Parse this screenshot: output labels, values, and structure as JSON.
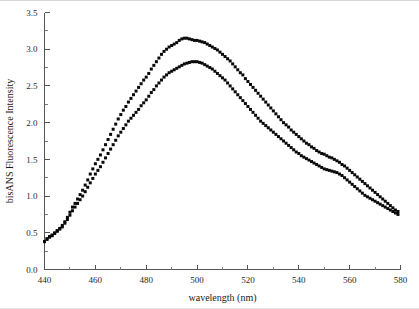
{
  "figure": {
    "background_color": "#ffffff",
    "marker_color": "#0a0a0a",
    "axis_color": "#555555"
  },
  "chart_data": {
    "type": "scatter",
    "title": "",
    "subtitle": "",
    "xlabel": "wavelength (nm)",
    "ylabel": "bisANS Fluorescence Intensity",
    "xlim": [
      440,
      580
    ],
    "ylim": [
      0.0,
      3.5
    ],
    "grid": false,
    "legend": "none",
    "x_ticks": [
      440,
      460,
      480,
      500,
      520,
      540,
      560,
      580
    ],
    "x_tick_labels": [
      "440",
      "460",
      "480",
      "500",
      "520",
      "540",
      "560",
      "580"
    ],
    "x_minor_tick_step": 10,
    "y_ticks": [
      0.0,
      0.5,
      1.0,
      1.5,
      2.0,
      2.5,
      3.0,
      3.5
    ],
    "y_tick_labels": [
      "0.0",
      "0.5",
      "1.0",
      "1.5",
      "2.0",
      "2.5",
      "3.0",
      "3.5"
    ],
    "y_minor_tick_step": 0.25,
    "marker_shape": "square",
    "marker_size_px": 3,
    "series": [
      {
        "name": "upper curve",
        "x": [
          440,
          441,
          442,
          443,
          444,
          445,
          446,
          447,
          448,
          449,
          450,
          451,
          452,
          453,
          454,
          455,
          456,
          457,
          458,
          459,
          460,
          461,
          462,
          463,
          464,
          465,
          466,
          467,
          468,
          469,
          470,
          471,
          472,
          473,
          474,
          475,
          476,
          477,
          478,
          479,
          480,
          481,
          482,
          483,
          484,
          485,
          486,
          487,
          488,
          489,
          490,
          491,
          492,
          493,
          494,
          495,
          496,
          497,
          498,
          499,
          500,
          501,
          502,
          503,
          504,
          505,
          506,
          507,
          508,
          509,
          510,
          511,
          512,
          513,
          514,
          515,
          516,
          517,
          518,
          519,
          520,
          521,
          522,
          523,
          524,
          525,
          526,
          527,
          528,
          529,
          530,
          531,
          532,
          533,
          534,
          535,
          536,
          537,
          538,
          539,
          540,
          541,
          542,
          543,
          544,
          545,
          546,
          547,
          548,
          549,
          550,
          551,
          552,
          553,
          554,
          555,
          556,
          557,
          558,
          559,
          560,
          561,
          562,
          563,
          564,
          565,
          566,
          567,
          568,
          569,
          570,
          571,
          572,
          573,
          574,
          575,
          576,
          577,
          578,
          579
        ],
        "y": [
          0.38,
          0.42,
          0.45,
          0.47,
          0.5,
          0.53,
          0.56,
          0.6,
          0.65,
          0.71,
          0.78,
          0.85,
          0.9,
          0.96,
          1.02,
          1.08,
          1.15,
          1.22,
          1.3,
          1.37,
          1.44,
          1.5,
          1.56,
          1.63,
          1.7,
          1.77,
          1.84,
          1.91,
          1.98,
          2.05,
          2.11,
          2.17,
          2.22,
          2.28,
          2.33,
          2.38,
          2.43,
          2.48,
          2.53,
          2.58,
          2.62,
          2.67,
          2.73,
          2.78,
          2.83,
          2.88,
          2.93,
          2.97,
          3.0,
          3.03,
          3.05,
          3.07,
          3.09,
          3.12,
          3.14,
          3.15,
          3.15,
          3.14,
          3.13,
          3.12,
          3.12,
          3.11,
          3.1,
          3.09,
          3.07,
          3.05,
          3.03,
          3.01,
          2.99,
          2.96,
          2.93,
          2.9,
          2.87,
          2.84,
          2.8,
          2.76,
          2.72,
          2.68,
          2.65,
          2.6,
          2.56,
          2.52,
          2.48,
          2.44,
          2.4,
          2.36,
          2.32,
          2.28,
          2.24,
          2.2,
          2.16,
          2.12,
          2.08,
          2.04,
          2.0,
          1.97,
          1.94,
          1.9,
          1.87,
          1.84,
          1.81,
          1.78,
          1.75,
          1.72,
          1.7,
          1.67,
          1.65,
          1.62,
          1.6,
          1.58,
          1.57,
          1.55,
          1.53,
          1.52,
          1.5,
          1.48,
          1.46,
          1.43,
          1.41,
          1.38,
          1.35,
          1.32,
          1.29,
          1.26,
          1.23,
          1.2,
          1.17,
          1.14,
          1.11,
          1.08,
          1.05,
          1.02,
          0.99,
          0.96,
          0.93,
          0.9,
          0.87,
          0.84,
          0.81,
          0.79
        ]
      },
      {
        "name": "lower curve",
        "x": [
          440,
          441,
          442,
          443,
          444,
          445,
          446,
          447,
          448,
          449,
          450,
          451,
          452,
          453,
          454,
          455,
          456,
          457,
          458,
          459,
          460,
          461,
          462,
          463,
          464,
          465,
          466,
          467,
          468,
          469,
          470,
          471,
          472,
          473,
          474,
          475,
          476,
          477,
          478,
          479,
          480,
          481,
          482,
          483,
          484,
          485,
          486,
          487,
          488,
          489,
          490,
          491,
          492,
          493,
          494,
          495,
          496,
          497,
          498,
          499,
          500,
          501,
          502,
          503,
          504,
          505,
          506,
          507,
          508,
          509,
          510,
          511,
          512,
          513,
          514,
          515,
          516,
          517,
          518,
          519,
          520,
          521,
          522,
          523,
          524,
          525,
          526,
          527,
          528,
          529,
          530,
          531,
          532,
          533,
          534,
          535,
          536,
          537,
          538,
          539,
          540,
          541,
          542,
          543,
          544,
          545,
          546,
          547,
          548,
          549,
          550,
          551,
          552,
          553,
          554,
          555,
          556,
          557,
          558,
          559,
          560,
          561,
          562,
          563,
          564,
          565,
          566,
          567,
          568,
          569,
          570,
          571,
          572,
          573,
          574,
          575,
          576,
          577,
          578,
          579
        ],
        "y": [
          0.38,
          0.41,
          0.44,
          0.46,
          0.49,
          0.52,
          0.55,
          0.58,
          0.63,
          0.68,
          0.74,
          0.8,
          0.85,
          0.9,
          0.95,
          1.0,
          1.06,
          1.12,
          1.18,
          1.24,
          1.3,
          1.35,
          1.4,
          1.46,
          1.52,
          1.58,
          1.64,
          1.7,
          1.76,
          1.82,
          1.87,
          1.92,
          1.97,
          2.02,
          2.06,
          2.1,
          2.14,
          2.18,
          2.23,
          2.27,
          2.31,
          2.36,
          2.41,
          2.45,
          2.5,
          2.54,
          2.58,
          2.62,
          2.65,
          2.68,
          2.7,
          2.72,
          2.74,
          2.76,
          2.78,
          2.8,
          2.81,
          2.82,
          2.83,
          2.83,
          2.83,
          2.82,
          2.81,
          2.79,
          2.77,
          2.75,
          2.73,
          2.7,
          2.67,
          2.64,
          2.61,
          2.58,
          2.54,
          2.5,
          2.46,
          2.42,
          2.38,
          2.34,
          2.3,
          2.26,
          2.22,
          2.18,
          2.14,
          2.1,
          2.06,
          2.02,
          1.99,
          1.96,
          1.93,
          1.9,
          1.87,
          1.84,
          1.81,
          1.78,
          1.75,
          1.72,
          1.69,
          1.66,
          1.63,
          1.6,
          1.58,
          1.55,
          1.53,
          1.51,
          1.49,
          1.47,
          1.45,
          1.43,
          1.41,
          1.39,
          1.37,
          1.36,
          1.35,
          1.34,
          1.33,
          1.32,
          1.3,
          1.28,
          1.25,
          1.22,
          1.19,
          1.16,
          1.13,
          1.1,
          1.07,
          1.04,
          1.01,
          0.99,
          0.97,
          0.95,
          0.93,
          0.91,
          0.89,
          0.87,
          0.85,
          0.83,
          0.81,
          0.79,
          0.77,
          0.75
        ]
      }
    ]
  }
}
